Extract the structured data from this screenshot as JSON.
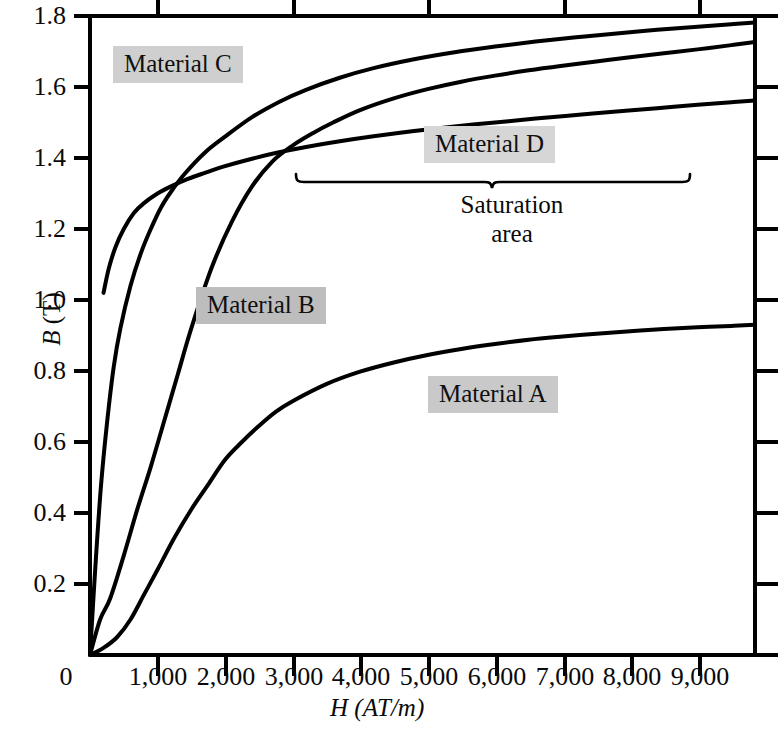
{
  "chart_data": {
    "type": "line",
    "title": "",
    "xlabel": "H (AT/m)",
    "ylabel": "B (T)",
    "xlim": [
      0,
      9850
    ],
    "ylim": [
      0,
      1.8
    ],
    "grid": false,
    "legend_position": "inline-callout-labels",
    "x_tick_labels": [
      "0",
      "1,000",
      "2,000",
      "3,000",
      "4,000",
      "5,000",
      "6,000",
      "7,000",
      "8,000",
      "9,000"
    ],
    "x_tick_values": [
      0,
      1000,
      2000,
      3000,
      4000,
      5000,
      6000,
      7000,
      8000,
      9000
    ],
    "y_tick_labels": [
      "0.2",
      "0.4",
      "0.6",
      "0.8",
      "1.0",
      "1.2",
      "1.4",
      "1.6",
      "1.8"
    ],
    "y_tick_values": [
      0.2,
      0.4,
      0.6,
      0.8,
      1.0,
      1.2,
      1.4,
      1.6,
      1.8
    ],
    "annotations": [
      {
        "text": "Saturation area",
        "kind": "brace-label",
        "x_start": 3000,
        "x_end": 9000
      }
    ],
    "series": [
      {
        "name": "Material A",
        "x": [
          0,
          200,
          400,
          600,
          800,
          1000,
          1250,
          1500,
          1750,
          2000,
          2250,
          2500,
          2750,
          3000,
          3500,
          4000,
          4500,
          5000,
          5500,
          6000,
          6500,
          7000,
          7500,
          8000,
          8500,
          9000,
          9500,
          9850
        ],
        "y": [
          0.0,
          0.02,
          0.05,
          0.1,
          0.17,
          0.24,
          0.33,
          0.41,
          0.48,
          0.55,
          0.6,
          0.645,
          0.685,
          0.715,
          0.763,
          0.798,
          0.824,
          0.845,
          0.862,
          0.876,
          0.888,
          0.897,
          0.905,
          0.912,
          0.918,
          0.923,
          0.927,
          0.93
        ]
      },
      {
        "name": "Material B",
        "x": [
          0,
          150,
          300,
          500,
          700,
          900,
          1100,
          1300,
          1500,
          1800,
          2100,
          2400,
          2700,
          3000,
          3300,
          3600,
          4000,
          4500,
          5000,
          5500,
          6000,
          6500,
          7000,
          7500,
          8000,
          8500,
          9000,
          9500,
          9850
        ],
        "y": [
          0.0,
          0.1,
          0.16,
          0.28,
          0.41,
          0.53,
          0.66,
          0.79,
          0.92,
          1.09,
          1.22,
          1.32,
          1.39,
          1.435,
          1.47,
          1.5,
          1.535,
          1.568,
          1.594,
          1.615,
          1.632,
          1.647,
          1.66,
          1.672,
          1.684,
          1.695,
          1.706,
          1.718,
          1.727
        ]
      },
      {
        "name": "Material C",
        "x": [
          0,
          80,
          160,
          250,
          350,
          450,
          600,
          750,
          900,
          1050,
          1200,
          1400,
          1700,
          2000,
          2400,
          2800,
          3200,
          3700,
          4200,
          4800,
          5400,
          6000,
          6600,
          7200,
          7800,
          8400,
          9000,
          9500,
          9850
        ],
        "y": [
          0.0,
          0.25,
          0.47,
          0.65,
          0.81,
          0.92,
          1.04,
          1.13,
          1.2,
          1.26,
          1.305,
          1.355,
          1.415,
          1.46,
          1.515,
          1.558,
          1.592,
          1.626,
          1.653,
          1.678,
          1.698,
          1.714,
          1.728,
          1.74,
          1.751,
          1.761,
          1.77,
          1.777,
          1.782
        ]
      },
      {
        "name": "Material D",
        "x": [
          200,
          280,
          380,
          500,
          650,
          800,
          1000,
          1200,
          1450,
          1700,
          2000,
          2400,
          2800,
          3200,
          3700,
          4200,
          4800,
          5400,
          6000,
          6600,
          7200,
          7800,
          8400,
          9000,
          9500,
          9850
        ],
        "y": [
          1.02,
          1.09,
          1.15,
          1.2,
          1.245,
          1.273,
          1.3,
          1.32,
          1.341,
          1.358,
          1.377,
          1.398,
          1.416,
          1.431,
          1.447,
          1.461,
          1.476,
          1.489,
          1.5,
          1.511,
          1.521,
          1.531,
          1.54,
          1.55,
          1.557,
          1.562
        ]
      }
    ]
  },
  "axes": {
    "y_title_var": "B",
    "y_title_unit": " (T)",
    "x_title_var": "H",
    "x_title_unit": " (AT/m)"
  },
  "labels": {
    "material_a": "Material A",
    "material_b": "Material B",
    "material_c": "Material C",
    "material_d": "Material D",
    "saturation_line1": "Saturation",
    "saturation_line2": "area"
  },
  "colors": {
    "curve": "#000000",
    "axis": "#000000",
    "background": "#ffffff",
    "label_highlight": "#cccccc"
  }
}
